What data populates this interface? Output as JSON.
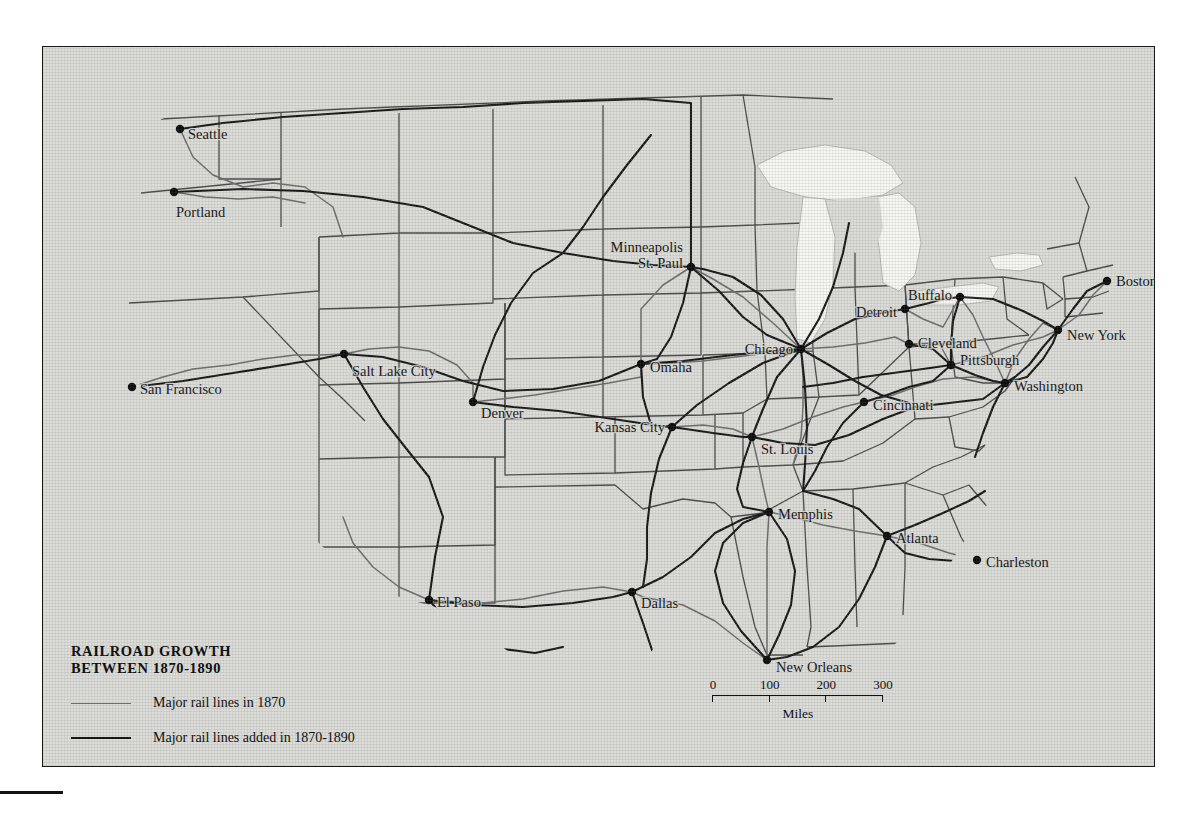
{
  "map": {
    "title_line1": "RAILROAD GROWTH",
    "title_line2": "BETWEEN 1870-1890",
    "title_full": "RAILROAD GROWTH\nBETWEEN 1870-1890",
    "legend": [
      {
        "style": "thin",
        "label": "Major rail lines in 1870"
      },
      {
        "style": "thick",
        "label": "Major rail lines added in 1870-1890"
      }
    ],
    "scale": {
      "ticks": [
        "0",
        "100",
        "200",
        "300"
      ],
      "unit": "Miles",
      "max_miles": 300
    },
    "colors": {
      "land": "#dcdcd8",
      "water": "#f7f7f4",
      "rail_1870": "#6d6d6d",
      "rail_added": "#171717",
      "state_border": "#4a4a48",
      "frame": "#1a1a1a",
      "page": "#ffffff",
      "label": "#111111"
    },
    "cities": [
      {
        "name": "Seattle",
        "x": 137,
        "y": 82,
        "anchor": "start",
        "dx": 8,
        "dy": 5
      },
      {
        "name": "Portland",
        "x": 131,
        "y": 145,
        "anchor": "start",
        "dx": 2,
        "dy": 20
      },
      {
        "name": "San Francisco",
        "x": 89,
        "y": 340,
        "anchor": "start",
        "dx": 8,
        "dy": 2
      },
      {
        "name": "Salt Lake City",
        "x": 301,
        "y": 307,
        "anchor": "start",
        "dx": 8,
        "dy": 17
      },
      {
        "name": "Denver",
        "x": 430,
        "y": 355,
        "anchor": "start",
        "dx": 8,
        "dy": 11
      },
      {
        "name": "El Paso",
        "x": 386,
        "y": 553,
        "anchor": "start",
        "dx": 8,
        "dy": 2
      },
      {
        "name": "Dallas",
        "x": 589,
        "y": 545,
        "anchor": "start",
        "dx": 9,
        "dy": 11
      },
      {
        "name": "New Orleans",
        "x": 724,
        "y": 613,
        "anchor": "start",
        "dx": 9,
        "dy": 7
      },
      {
        "name": "Memphis",
        "x": 726,
        "y": 465,
        "anchor": "start",
        "dx": 9,
        "dy": 2
      },
      {
        "name": "Atlanta",
        "x": 844,
        "y": 489,
        "anchor": "start",
        "dx": 9,
        "dy": 2
      },
      {
        "name": "Charleston",
        "x": 934,
        "y": 513,
        "anchor": "start",
        "dx": 9,
        "dy": 2
      },
      {
        "name": "Kansas City",
        "x": 629,
        "y": 380,
        "anchor": "end",
        "dx": -7,
        "dy": 0
      },
      {
        "name": "Omaha",
        "x": 598,
        "y": 317,
        "anchor": "start",
        "dx": 9,
        "dy": 3
      },
      {
        "name": "St. Louis",
        "x": 709,
        "y": 390,
        "anchor": "start",
        "dx": 9,
        "dy": 12
      },
      {
        "name": "Chicago",
        "x": 758,
        "y": 302,
        "anchor": "end",
        "dx": -8,
        "dy": 0
      },
      {
        "name": "Minneapolis",
        "x": 648,
        "y": 220,
        "anchor": "end",
        "dx": -8,
        "dy": -20
      },
      {
        "name": "St. Paul",
        "x": 648,
        "y": 220,
        "anchor": "end",
        "dx": -8,
        "dy": -4
      },
      {
        "name": "Detroit",
        "x": 862,
        "y": 262,
        "anchor": "end",
        "dx": -8,
        "dy": 3
      },
      {
        "name": "Cincinnati",
        "x": 821,
        "y": 355,
        "anchor": "start",
        "dx": 9,
        "dy": 3
      },
      {
        "name": "Cleveland",
        "x": 866,
        "y": 297,
        "anchor": "start",
        "dx": 9,
        "dy": -1
      },
      {
        "name": "Pittsburgh",
        "x": 908,
        "y": 318,
        "anchor": "start",
        "dx": 9,
        "dy": -5
      },
      {
        "name": "Buffalo",
        "x": 917,
        "y": 250,
        "anchor": "end",
        "dx": -8,
        "dy": -2
      },
      {
        "name": "Washington",
        "x": 962,
        "y": 336,
        "anchor": "start",
        "dx": 9,
        "dy": 3
      },
      {
        "name": "New York",
        "x": 1015,
        "y": 283,
        "anchor": "start",
        "dx": 9,
        "dy": 5
      },
      {
        "name": "Boston",
        "x": 1064,
        "y": 234,
        "anchor": "start",
        "dx": 9,
        "dy": 0
      }
    ]
  }
}
